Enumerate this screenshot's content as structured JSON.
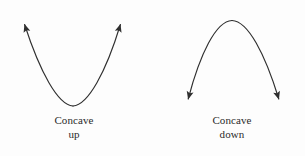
{
  "figure": {
    "background_color": "#fdfdfd",
    "stroke_color": "#2f2f2f",
    "text_color": "#2b2b2b",
    "panels": [
      {
        "name": "concave-up",
        "caption_line1": "Concave",
        "caption_line2": "up",
        "curve_type": "parabola-opening-up",
        "arrow_direction": "up-outward",
        "vertex": {
          "x": 73,
          "y": 106
        },
        "left_tip": {
          "x": 22,
          "y": 17
        },
        "right_tip": {
          "x": 122,
          "y": 17
        }
      },
      {
        "name": "concave-down",
        "caption_line1": "Concave",
        "caption_line2": "down",
        "curve_type": "parabola-opening-down",
        "arrow_direction": "down-outward",
        "vertex": {
          "x": 232,
          "y": 20
        },
        "left_tip": {
          "x": 186,
          "y": 106
        },
        "right_tip": {
          "x": 281,
          "y": 106
        }
      }
    ]
  }
}
